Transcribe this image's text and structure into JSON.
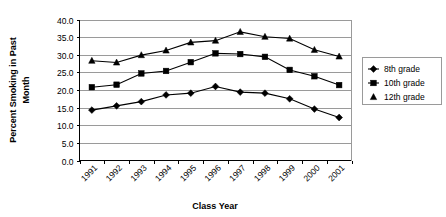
{
  "chart_data": {
    "type": "line",
    "title": "",
    "xlabel": "Class Year",
    "ylabel": "Percent Smoking in Past Month",
    "ylabel_line1": "Percent Smoking in Past",
    "ylabel_line2": "Month",
    "categories": [
      "1991",
      "1992",
      "1993",
      "1994",
      "1995",
      "1996",
      "1997",
      "1998",
      "1999",
      "2000",
      "2001"
    ],
    "ylim": [
      0.0,
      40.0
    ],
    "ytick_step": 5.0,
    "ytick_labels": [
      "0.0",
      "5.0",
      "10.0",
      "15.0",
      "20.0",
      "25.0",
      "30.0",
      "35.0",
      "40.0"
    ],
    "ytick_values": [
      0.0,
      5.0,
      10.0,
      15.0,
      20.0,
      25.0,
      30.0,
      35.0,
      40.0
    ],
    "grid": "horizontal",
    "legend_position": "right",
    "series": [
      {
        "name": "8th grade",
        "marker": "diamond",
        "color": "#000000",
        "values": [
          14.3,
          15.5,
          16.7,
          18.6,
          19.1,
          21.0,
          19.4,
          19.1,
          17.5,
          14.6,
          12.2
        ]
      },
      {
        "name": "10th grade",
        "marker": "square",
        "color": "#000000",
        "values": [
          20.8,
          21.5,
          24.7,
          25.4,
          27.9,
          30.4,
          30.2,
          29.4,
          25.7,
          23.9,
          21.4
        ]
      },
      {
        "name": "12th grade",
        "marker": "triangle",
        "color": "#000000",
        "values": [
          28.3,
          27.8,
          29.9,
          31.2,
          33.5,
          34.0,
          36.5,
          35.1,
          34.6,
          31.4,
          29.5
        ]
      }
    ]
  },
  "legend": {
    "items": [
      {
        "label": "8th grade"
      },
      {
        "label": "10th grade"
      },
      {
        "label": "12th grade"
      }
    ]
  }
}
